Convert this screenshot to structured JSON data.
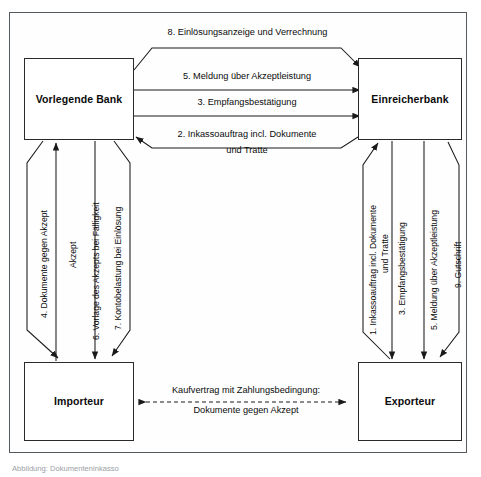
{
  "figure": {
    "caption": "Abbildung: Dokumenteninkasso",
    "frame_color": "#555a5e",
    "box_border_color": "#2a2a2a",
    "line_color": "#1a1a1a",
    "background": "#ffffff"
  },
  "nodes": {
    "vorlegende_bank": "Vorlegende Bank",
    "einreicherbank": "Einreicherbank",
    "importeur": "Importeur",
    "exporteur": "Exporteur"
  },
  "edges": {
    "top": {
      "e8": "8. Einlösungsanzeige und Verrechnung",
      "e5": "5. Meldung über Akzeptleistung",
      "e3": "3. Empfangsbestätigung",
      "e2_line1": "2. Inkassoauftrag incl. Dokumente",
      "e2_line2": "und Tratte"
    },
    "left": {
      "e4": "4. Dokumente gegen Akzept",
      "akzept": "Akzept",
      "e6": "6. Vorlage des Akzepts bei Fälligkeit",
      "e7": "7. Kontobelastung bei Einlösung"
    },
    "right": {
      "e1_line1": "1. Inkassoauftrag incl. Dokumente",
      "e1_line2": "und Tratte",
      "e3": "3. Empfangsbestätigung",
      "e5": "5. Meldung über Akzeptleistung",
      "e9": "9. Gutschrift"
    },
    "bottom": {
      "contract_line1": "Kaufvertrag mit Zahlungsbedingung:",
      "contract_line2": "Dokumente gegen Akzept"
    }
  }
}
